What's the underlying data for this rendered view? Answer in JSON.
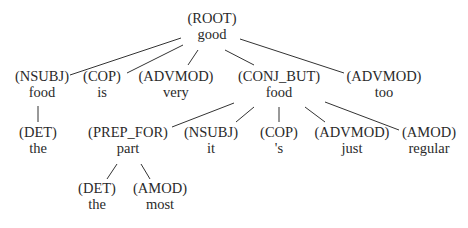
{
  "diagram": {
    "type": "dependency-tree",
    "nodes": [
      {
        "id": "n0",
        "label": "(ROOT)",
        "word": "good",
        "x": 212,
        "y": 23
      },
      {
        "id": "n1",
        "label": "(NSUBJ)",
        "word": "food",
        "x": 42,
        "y": 81
      },
      {
        "id": "n2",
        "label": "(COP)",
        "word": "is",
        "x": 102,
        "y": 81
      },
      {
        "id": "n3",
        "label": "(ADVMOD)",
        "word": "very",
        "x": 176,
        "y": 81
      },
      {
        "id": "n4",
        "label": "(CONJ_BUT)",
        "word": "food",
        "x": 279,
        "y": 81
      },
      {
        "id": "n5",
        "label": "(ADVMOD)",
        "word": "too",
        "x": 384,
        "y": 81
      },
      {
        "id": "n6",
        "label": "(DET)",
        "word": "the",
        "x": 38,
        "y": 137
      },
      {
        "id": "n7",
        "label": "(PREP_FOR)",
        "word": "part",
        "x": 128,
        "y": 137
      },
      {
        "id": "n8",
        "label": "(NSUBJ)",
        "word": "it",
        "x": 211,
        "y": 137
      },
      {
        "id": "n9",
        "label": "(COP)",
        "word": "'s",
        "x": 279,
        "y": 137
      },
      {
        "id": "n10",
        "label": "(ADVMOD)",
        "word": "just",
        "x": 352,
        "y": 137
      },
      {
        "id": "n11",
        "label": "(AMOD)",
        "word": "regular",
        "x": 429,
        "y": 137
      },
      {
        "id": "n12",
        "label": "(DET)",
        "word": "the",
        "x": 97,
        "y": 193
      },
      {
        "id": "n13",
        "label": "(AMOD)",
        "word": "most",
        "x": 160,
        "y": 193
      }
    ],
    "edges": [
      {
        "from": "n0",
        "to": "n1",
        "x1": 181,
        "y1": 38,
        "x2": 70,
        "y2": 75
      },
      {
        "from": "n0",
        "to": "n2",
        "x1": 183,
        "y1": 45,
        "x2": 127,
        "y2": 73
      },
      {
        "from": "n0",
        "to": "n3",
        "x1": 198,
        "y1": 50,
        "x2": 188,
        "y2": 65
      },
      {
        "from": "n0",
        "to": "n4",
        "x1": 225,
        "y1": 50,
        "x2": 254,
        "y2": 65
      },
      {
        "from": "n0",
        "to": "n5",
        "x1": 240,
        "y1": 39,
        "x2": 344,
        "y2": 73
      },
      {
        "from": "n1",
        "to": "n6",
        "x1": 38,
        "y1": 106,
        "x2": 38,
        "y2": 122
      },
      {
        "from": "n4",
        "to": "n7",
        "x1": 234,
        "y1": 103,
        "x2": 172,
        "y2": 127
      },
      {
        "from": "n4",
        "to": "n8",
        "x1": 254,
        "y1": 107,
        "x2": 236,
        "y2": 122
      },
      {
        "from": "n4",
        "to": "n9",
        "x1": 279,
        "y1": 107,
        "x2": 279,
        "y2": 122
      },
      {
        "from": "n4",
        "to": "n10",
        "x1": 305,
        "y1": 107,
        "x2": 325,
        "y2": 122
      },
      {
        "from": "n4",
        "to": "n11",
        "x1": 325,
        "y1": 102,
        "x2": 399,
        "y2": 130
      },
      {
        "from": "n7",
        "to": "n12",
        "x1": 117,
        "y1": 164,
        "x2": 107,
        "y2": 179
      },
      {
        "from": "n7",
        "to": "n13",
        "x1": 141,
        "y1": 164,
        "x2": 150,
        "y2": 179
      }
    ]
  }
}
